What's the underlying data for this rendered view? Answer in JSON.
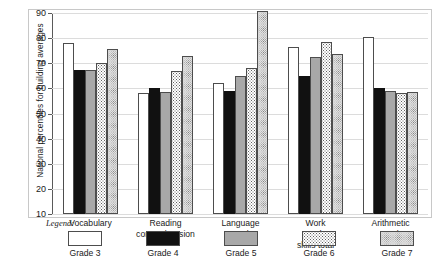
{
  "chart_data": {
    "type": "bar",
    "title": "",
    "xlabel": "",
    "ylabel": "National percentiles for building averages",
    "ylim": [
      10,
      90
    ],
    "yticks": [
      10,
      20,
      30,
      40,
      50,
      60,
      70,
      80,
      90
    ],
    "grid": true,
    "legend_position": "below",
    "legend_title": "Legend:",
    "categories": [
      "Vocabulary",
      "Reading\ncomprehension",
      "Language\ntotal",
      "Work study\nskills total",
      "Arithmetic\ntotal"
    ],
    "series": [
      {
        "name": "Grade 3",
        "pattern": "white",
        "values": [
          78.0,
          58.0,
          62.0,
          76.5,
          80.5
        ]
      },
      {
        "name": "Grade 4",
        "pattern": "black",
        "values": [
          67.5,
          60.0,
          59.0,
          65.0,
          60.0
        ]
      },
      {
        "name": "Grade 5",
        "pattern": "gray",
        "values": [
          67.5,
          58.5,
          65.0,
          72.5,
          59.0
        ]
      },
      {
        "name": "Grade 6",
        "pattern": "dots-light",
        "values": [
          70.0,
          67.0,
          68.0,
          78.5,
          58.0
        ]
      },
      {
        "name": "Grade 7",
        "pattern": "dots-dense",
        "values": [
          75.5,
          73.0,
          91.0,
          73.5,
          58.5
        ]
      }
    ]
  }
}
